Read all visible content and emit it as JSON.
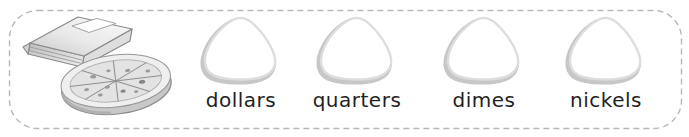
{
  "worksheet": {
    "item_illustration": "pizza-box-and-pizza",
    "categories": [
      {
        "label": "dollars"
      },
      {
        "label": "quarters"
      },
      {
        "label": "dimes"
      },
      {
        "label": "nickels"
      }
    ],
    "answer_spots": 4,
    "colors": {
      "background": "#ffffff",
      "border_dash": "#b8b8b8",
      "shape_stroke": "#dddddd",
      "shape_shadow": "#c7c7c7",
      "label_text": "#1f1f1f",
      "illustration_line": "#8a8a8a"
    }
  }
}
